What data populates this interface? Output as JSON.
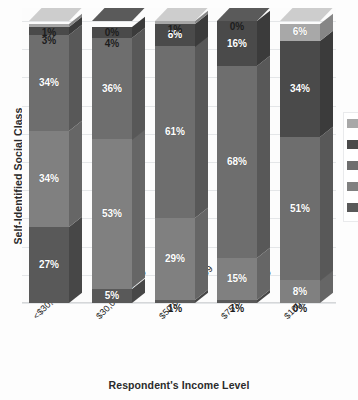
{
  "chart_data": {
    "type": "bar",
    "subtype": "stacked-100-percent-3d",
    "title": "",
    "xlabel": "Respondent's Income Level",
    "ylabel": "Self-Identified Social Class",
    "categories": [
      "<$30,000",
      "$30,000–49,999",
      "$50,000–$74,999",
      "$75,000–99,999",
      "$100,000+"
    ],
    "series": [
      {
        "name": "Lower class",
        "values": [
          27,
          5,
          1,
          1,
          0
        ],
        "color": "#595959"
      },
      {
        "name": "Working class",
        "values": [
          34,
          53,
          29,
          15,
          8
        ],
        "color": "#808080"
      },
      {
        "name": "Middle class",
        "values": [
          34,
          36,
          61,
          68,
          51
        ],
        "color": "#6e6e6e"
      },
      {
        "name": "Upper-middle class",
        "values": [
          3,
          4,
          8,
          16,
          34
        ],
        "color": "#4a4a4a"
      },
      {
        "name": "Upper class",
        "values": [
          1,
          0,
          1,
          0,
          6
        ],
        "color": "#a8a8a8"
      }
    ],
    "value_labels": [
      [
        "27%",
        "34%",
        "34%",
        "3%",
        "1%"
      ],
      [
        "5%",
        "53%",
        "36%",
        "4%",
        "0%"
      ],
      [
        "1%",
        "29%",
        "61%",
        "8%",
        "1%"
      ],
      [
        "1%",
        "15%",
        "68%",
        "16%",
        "0%"
      ],
      [
        "0%",
        "8%",
        "51%",
        "34%",
        "6%"
      ]
    ],
    "ylim": [
      0,
      100
    ],
    "ytick_labels": [],
    "grid": true,
    "grid_count": 10,
    "legend_position": "right-cropped",
    "units": "percent"
  },
  "axes": {
    "y_title": "Self-Identified Social Class",
    "x_title": "Respondent's Income Level"
  },
  "legend": {
    "entries": [
      {
        "label": "Upper class",
        "color": "#a8a8a8"
      },
      {
        "label": "Upper-middle class",
        "color": "#4a4a4a"
      },
      {
        "label": "Middle class",
        "color": "#6e6e6e"
      },
      {
        "label": "Working class",
        "color": "#808080"
      },
      {
        "label": "Lower class",
        "color": "#595959"
      }
    ]
  },
  "palette": {
    "background": "#fdfdfd",
    "plot_background": "#fcfcfc",
    "gridline": "#e4e6e8",
    "baseline": "#d5d7d9",
    "label_text": "#ffffff",
    "outside_label_text": "#1d1d1d",
    "axis_title_text": "#2b2b2b"
  }
}
